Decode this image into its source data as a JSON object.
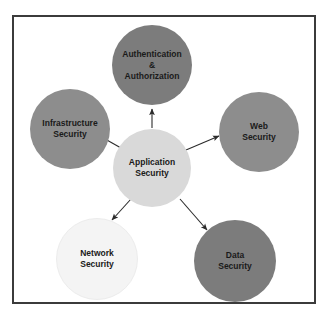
{
  "figure": {
    "top_cropped_text": "",
    "panel_background": "#ffffff",
    "panel_border_color": "#3b3b3b"
  },
  "diagram": {
    "type": "hub-and-spoke",
    "center": {
      "id": "application-security",
      "label_line1": "Application",
      "label_line2": "Security",
      "fill": "#d9d9d9"
    },
    "nodes": [
      {
        "id": "authentication-authorization",
        "label_line1": "Authentication",
        "label_line2": "&",
        "label_line3": "Authorization",
        "fill": "#7c7c7c",
        "position": "top"
      },
      {
        "id": "infrastructure-security",
        "label_line1": "Infrastructure",
        "label_line2": "Security",
        "fill": "#8d8d8d",
        "position": "upper-left"
      },
      {
        "id": "web-security",
        "label_line1": "Web",
        "label_line2": "Security",
        "fill": "#8d8d8d",
        "position": "upper-right"
      },
      {
        "id": "network-security",
        "label_line1": "Network",
        "label_line2": "Security",
        "fill": "#f4f4f4",
        "position": "lower-left"
      },
      {
        "id": "data-security",
        "label_line1": "Data",
        "label_line2": "Security",
        "fill": "#7c7c7c",
        "position": "lower-right"
      }
    ],
    "edges": [
      {
        "from": "application-security",
        "to": "authentication-authorization",
        "arrow": "single"
      },
      {
        "from": "application-security",
        "to": "infrastructure-security",
        "arrow": "single"
      },
      {
        "from": "application-security",
        "to": "web-security",
        "arrow": "single"
      },
      {
        "from": "application-security",
        "to": "network-security",
        "arrow": "single"
      },
      {
        "from": "application-security",
        "to": "data-security",
        "arrow": "single"
      }
    ],
    "edge_color": "#2b2b2b"
  }
}
